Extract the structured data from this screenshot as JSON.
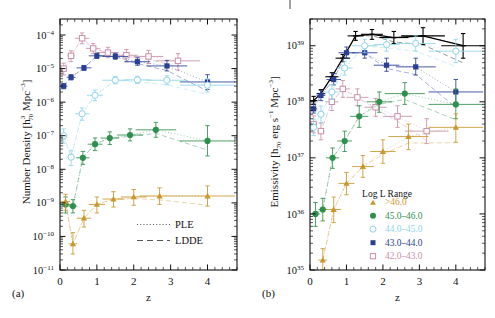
{
  "figure": {
    "panels": [
      {
        "id": "a",
        "label": "(a)",
        "ylabel": "Number Density [h³₇₀ Mpc⁻³]",
        "xlabel": "z"
      },
      {
        "id": "b",
        "label": "(b)",
        "ylabel": "Emissivity [h₇₀ erg s⁻¹ Mpc⁻³]",
        "xlabel": "z"
      }
    ]
  },
  "line_legend": {
    "items": [
      {
        "name": "ple",
        "label": "PLE",
        "style": "dotted"
      },
      {
        "name": "ldde",
        "label": "LDDE",
        "style": "dashed"
      }
    ]
  },
  "series_legend": {
    "title": "Log L Range",
    "items": [
      {
        "label": ">46.0",
        "marker": "triangle-filled",
        "color": "#c8972e"
      },
      {
        "label": "45.0–46.0",
        "marker": "circle-filled",
        "color": "#2f8f4e"
      },
      {
        "label": "44.0–45.0",
        "marker": "circle-open",
        "color": "#8fd4e8"
      },
      {
        "label": "43.0–44.0",
        "marker": "square-filled",
        "color": "#2a3f93"
      },
      {
        "label": "42.0–43.0",
        "marker": "square-open",
        "color": "#c98fa8"
      }
    ]
  },
  "chart_data": [
    {
      "type": "scatter",
      "panel": "a",
      "title": "",
      "xlabel": "z",
      "ylabel": "Number Density [h3_70 Mpc-3]",
      "xlim": [
        0,
        4.8
      ],
      "ylim": [
        1e-11,
        0.0003
      ],
      "xticks": [
        0,
        1,
        2,
        3,
        4
      ],
      "yticks": [
        0.0001,
        1e-05,
        1e-06,
        1e-07,
        1e-08,
        1e-09,
        1e-10,
        1e-11
      ],
      "ytick_labels": [
        "10-4",
        "10-5",
        "10-6",
        "10-7",
        "10-8",
        "10-9",
        "10-10",
        "10-11"
      ],
      "grid": false,
      "log_y": true,
      "series": [
        {
          "name": "42.0-43.0",
          "color": "#c98fa8",
          "marker": "square-open",
          "x": [
            0.1,
            0.3,
            0.6,
            0.9,
            1.3,
            1.8,
            2.4,
            3.2
          ],
          "xerr": [
            0.1,
            0.1,
            0.2,
            0.2,
            0.3,
            0.3,
            0.4,
            0.6
          ],
          "y": [
            1e-05,
            2.4e-05,
            8e-05,
            4e-05,
            3e-05,
            2.5e-05,
            2.3e-05,
            1.7e-05
          ],
          "yerr_lo": [
            3.5e-06,
            8e-06,
            2.5e-05,
            1.2e-05,
            9e-06,
            9e-06,
            9e-06,
            8e-06
          ],
          "yerr_hi": [
            4.5e-06,
            1e-05,
            3.5e-05,
            1.6e-05,
            1.3e-05,
            1.2e-05,
            1.2e-05,
            1.1e-05
          ]
        },
        {
          "name": "43.0-44.0",
          "color": "#2a3f93",
          "marker": "square-filled",
          "x": [
            0.1,
            0.3,
            0.65,
            1.0,
            1.5,
            2.1,
            2.9,
            4.0
          ],
          "xerr": [
            0.1,
            0.12,
            0.2,
            0.22,
            0.35,
            0.35,
            0.55,
            0.75
          ],
          "y": [
            3e-06,
            5.5e-06,
            1.05e-05,
            2.4e-05,
            2.3e-05,
            1.6e-05,
            1.2e-05,
            4e-06
          ],
          "yerr_lo": [
            5e-07,
            9e-07,
            1.6e-06,
            4e-06,
            4e-06,
            3.5e-06,
            3.5e-06,
            1.6e-06
          ],
          "yerr_hi": [
            6e-07,
            1.1e-06,
            1.9e-06,
            5e-06,
            5.5e-06,
            5e-06,
            5.5e-06,
            2.6e-06
          ]
        },
        {
          "name": "44.0-45.0",
          "color": "#8fd4e8",
          "marker": "circle-open",
          "x": [
            0.1,
            0.3,
            0.6,
            0.95,
            1.5,
            2.1,
            2.9,
            4.0
          ],
          "xerr": [
            0.1,
            0.12,
            0.2,
            0.22,
            0.35,
            0.35,
            0.55,
            0.75
          ],
          "y": [
            1e-07,
            2.3e-08,
            4.5e-07,
            1.6e-06,
            4.5e-06,
            4.6e-06,
            4.5e-06,
            3.2e-06
          ],
          "yerr_lo": [
            4e-08,
            1e-08,
            1.6e-07,
            5e-07,
            1e-06,
            1e-06,
            1.2e-06,
            1.2e-06
          ],
          "yerr_hi": [
            6e-08,
            1.4e-08,
            2.2e-07,
            7e-07,
            1.3e-06,
            1.3e-06,
            1.6e-06,
            1.8e-06
          ]
        },
        {
          "name": "45.0-46.0",
          "color": "#2f8f4e",
          "marker": "circle-filled",
          "x": [
            0.15,
            0.35,
            0.62,
            0.95,
            1.35,
            1.9,
            2.6,
            4.0
          ],
          "xerr": [
            0.12,
            0.12,
            0.18,
            0.2,
            0.25,
            0.35,
            0.55,
            0.75
          ],
          "y": [
            9e-10,
            8e-10,
            2.2e-08,
            5.6e-08,
            8.5e-08,
            1.05e-07,
            1.5e-07,
            7e-08
          ],
          "yerr_lo": [
            4e-10,
            3e-10,
            8e-09,
            2e-08,
            3e-08,
            3.5e-08,
            6e-08,
            4.5e-08
          ],
          "yerr_hi": [
            6e-10,
            4.5e-10,
            1.2e-08,
            3e-08,
            4.5e-08,
            5.5e-08,
            1e-07,
            1.3e-07
          ]
        },
        {
          "name": ">46.0",
          "color": "#c8972e",
          "marker": "triangle-filled",
          "x": [
            0.15,
            0.35,
            0.65,
            1.0,
            1.45,
            2.0,
            2.7,
            4.0
          ],
          "xerr": [
            0.12,
            0.12,
            0.2,
            0.22,
            0.3,
            0.35,
            0.55,
            0.75
          ],
          "y": [
            1.1e-09,
            6e-11,
            3.5e-10,
            9e-10,
            1.3e-09,
            1.5e-09,
            1.6e-09,
            1.6e-09
          ],
          "yerr_lo": [
            5e-10,
            3e-11,
            1.6e-10,
            4e-10,
            5.5e-10,
            6.5e-10,
            7e-10,
            8e-10
          ],
          "yerr_hi": [
            7e-10,
            7e-11,
            2.5e-10,
            6e-10,
            8.5e-10,
            1e-09,
            1.2e-09,
            1.6e-09
          ]
        }
      ]
    },
    {
      "type": "scatter",
      "panel": "b",
      "title": "",
      "xlabel": "z",
      "ylabel": "Emissivity [h_70 erg s-1 Mpc-3]",
      "xlim": [
        0,
        4.8
      ],
      "ylim": [
        1e+35,
        3e+39
      ],
      "xticks": [
        0,
        1,
        2,
        3,
        4
      ],
      "yticks": [
        1e+39,
        1e+38,
        1e+37,
        1e+36,
        1e+35
      ],
      "ytick_labels": [
        "1039",
        "1038",
        "1037",
        "1036",
        "1035"
      ],
      "grid": false,
      "log_y": true,
      "series": [
        {
          "name": "total",
          "color": "#000000",
          "marker": "cross",
          "x": [
            0.1,
            0.3,
            0.6,
            0.9,
            1.25,
            1.7,
            2.3,
            3.1,
            4.2
          ],
          "xerr": [
            0.1,
            0.12,
            0.18,
            0.2,
            0.22,
            0.3,
            0.4,
            0.6,
            0.6
          ],
          "y": [
            1.05e+38,
            1.4e+38,
            2.8e+38,
            6e+38,
            1.5e+39,
            1.6e+39,
            1.4e+39,
            1.5e+39,
            1e+39
          ],
          "yerr_lo": [
            1.5e+37,
            2e+37,
            4e+37,
            8e+37,
            2.5e+38,
            3e+38,
            3e+38,
            4.5e+38,
            4e+38
          ],
          "yerr_hi": [
            2e+37,
            2.5e+37,
            5e+37,
            1e+38,
            3e+38,
            3.5e+38,
            4e+38,
            6e+38,
            6.5e+38
          ]
        },
        {
          "name": "42.0-43.0",
          "color": "#c98fa8",
          "marker": "square-open",
          "x": [
            0.1,
            0.3,
            0.6,
            0.9,
            1.3,
            1.8,
            2.4,
            3.2
          ],
          "xerr": [
            0.1,
            0.1,
            0.18,
            0.2,
            0.3,
            0.3,
            0.4,
            0.6
          ],
          "y": [
            4e+37,
            3e+37,
            1e+38,
            1.7e+38,
            1.2e+38,
            8e+37,
            5.5e+37,
            3e+37
          ],
          "yerr_lo": [
            1.2e+37,
            9e+36,
            3e+37,
            5e+37,
            3.5e+37,
            2.5e+37,
            2e+37,
            1.2e+37
          ],
          "yerr_hi": [
            1.6e+37,
            1.2e+37,
            4e+37,
            7e+37,
            5e+37,
            3.5e+37,
            3e+37,
            2e+37
          ]
        },
        {
          "name": "43.0-44.0",
          "color": "#2a3f93",
          "marker": "square-filled",
          "x": [
            0.1,
            0.3,
            0.65,
            1.0,
            1.5,
            2.1,
            2.9,
            4.0
          ],
          "xerr": [
            0.1,
            0.12,
            0.2,
            0.22,
            0.35,
            0.35,
            0.55,
            0.75
          ],
          "y": [
            7.5e+37,
            1.3e+38,
            2.5e+38,
            7.5e+38,
            7.5e+38,
            4.5e+38,
            4.2e+38,
            1.5e+38
          ],
          "yerr_lo": [
            1.2e+37,
            2.5e+37,
            5e+37,
            1.5e+38,
            1.5e+38,
            1e+38,
            1.2e+38,
            6e+37
          ],
          "yerr_hi": [
            1.6e+37,
            3e+37,
            7e+37,
            2e+38,
            2e+38,
            1.5e+38,
            1.8e+38,
            1e+38
          ]
        },
        {
          "name": "44.0-45.0",
          "color": "#8fd4e8",
          "marker": "circle-open",
          "x": [
            0.1,
            0.3,
            0.6,
            0.95,
            1.5,
            2.1,
            2.9,
            4.0
          ],
          "xerr": [
            0.1,
            0.12,
            0.18,
            0.22,
            0.35,
            0.35,
            0.55,
            0.75
          ],
          "y": [
            3.5e+37,
            6e+37,
            1.5e+38,
            4e+38,
            1e+39,
            1.05e+39,
            1.1e+39,
            8e+38
          ],
          "yerr_lo": [
            1e+37,
            1.8e+37,
            4e+37,
            1e+38,
            2.5e+38,
            2.5e+38,
            3e+38,
            3e+38
          ],
          "yerr_hi": [
            1.4e+37,
            2.4e+37,
            5e+37,
            1.3e+38,
            3e+38,
            3e+38,
            4e+38,
            5e+38
          ]
        },
        {
          "name": "45.0-46.0",
          "color": "#2f8f4e",
          "marker": "circle-filled",
          "x": [
            0.15,
            0.35,
            0.62,
            0.95,
            1.35,
            1.9,
            2.6,
            4.0
          ],
          "xerr": [
            0.12,
            0.12,
            0.18,
            0.2,
            0.25,
            0.35,
            0.55,
            0.75
          ],
          "y": [
            1e+36,
            1.2e+36,
            1e+37,
            2e+37,
            5.5e+37,
            1e+38,
            1.4e+38,
            9e+37
          ],
          "yerr_lo": [
            4e+35,
            4.5e+35,
            3.5e+36,
            7e+36,
            2e+37,
            3.5e+37,
            5e+37,
            4e+37
          ],
          "yerr_hi": [
            6e+35,
            7e+35,
            5e+36,
            1e+37,
            3e+37,
            5e+37,
            8e+37,
            8e+37
          ]
        },
        {
          "name": ">46.0",
          "color": "#c8972e",
          "marker": "triangle-filled",
          "x": [
            0.35,
            0.65,
            1.0,
            1.45,
            2.0,
            2.7,
            4.0
          ],
          "xerr": [
            0.12,
            0.2,
            0.22,
            0.3,
            0.35,
            0.55,
            0.75
          ],
          "y": [
            1.5e+35,
            1.2e+36,
            3.5e+36,
            7e+36,
            1.3e+37,
            2.4e+37,
            3.5e+37
          ],
          "yerr_lo": [
            6e+34,
            5e+35,
            1.3e+36,
            2.5e+36,
            5e+36,
            1e+37,
            1.6e+37
          ],
          "yerr_hi": [
            9e+34,
            8e+35,
            2e+36,
            4e+36,
            8e+36,
            1.6e+37,
            2.6e+37
          ]
        }
      ]
    }
  ]
}
